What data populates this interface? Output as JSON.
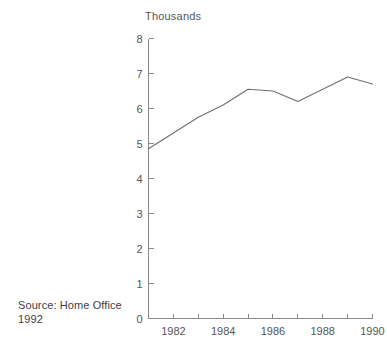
{
  "chart_data": {
    "type": "line",
    "title": "Thousands",
    "xlabel": "",
    "ylabel": "",
    "x": [
      1981,
      1982,
      1983,
      1984,
      1985,
      1986,
      1987,
      1988,
      1989,
      1990
    ],
    "values": [
      4.85,
      5.3,
      5.75,
      6.1,
      6.55,
      6.5,
      6.2,
      6.55,
      6.9,
      6.7
    ],
    "series": [
      {
        "name": "Thousands",
        "values": [
          4.85,
          5.3,
          5.75,
          6.1,
          6.55,
          6.5,
          6.2,
          6.55,
          6.9,
          6.7
        ]
      }
    ],
    "xlim": [
      1981,
      1990
    ],
    "ylim": [
      0,
      8
    ],
    "y_ticks": [
      0,
      1,
      2,
      3,
      4,
      5,
      6,
      7,
      8
    ],
    "y_tick_labels": [
      "0",
      "1",
      "2",
      "3",
      "4",
      "5",
      "6",
      "7",
      "8"
    ],
    "x_ticks": [
      1981,
      1982,
      1983,
      1984,
      1985,
      1986,
      1987,
      1988,
      1989,
      1990
    ],
    "x_tick_labels": [
      "",
      "1982",
      "",
      "1984",
      "",
      "1986",
      "",
      "1988",
      "",
      "1990"
    ],
    "grid": false,
    "legend": false,
    "line_color": "#6f6f6f",
    "axis_color": "#8a8a8a",
    "background": "#ffffff"
  },
  "annotations": {
    "source": "Source: Home Office\n1992"
  }
}
